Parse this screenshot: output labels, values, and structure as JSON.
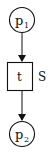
{
  "diagram": {
    "type": "petri-net",
    "places": [
      {
        "id": "p1",
        "label": "p",
        "subscript": "1"
      },
      {
        "id": "p2",
        "label": "p",
        "subscript": "2"
      }
    ],
    "transition": {
      "id": "t",
      "label": "t",
      "side_label": "S"
    },
    "arcs": [
      {
        "from": "p1",
        "to": "t"
      },
      {
        "from": "t",
        "to": "p2"
      }
    ],
    "colors": {
      "stroke": "#111111",
      "background": "#ffffff"
    }
  }
}
